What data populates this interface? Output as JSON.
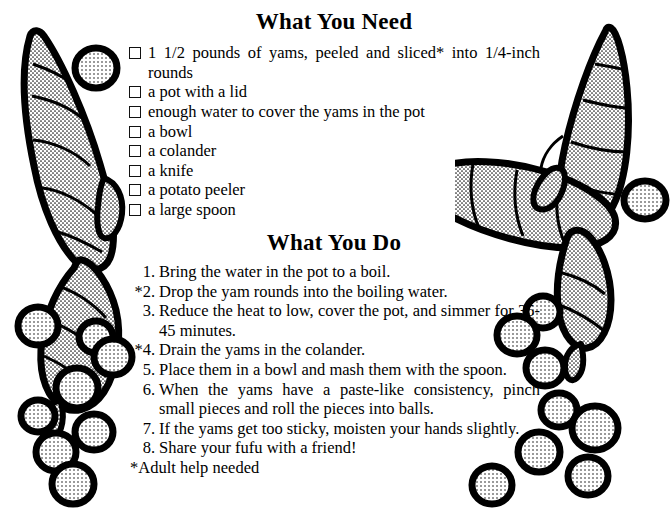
{
  "page": {
    "background_color": "#ffffff",
    "ink_color": "#000000"
  },
  "sections": {
    "needs": {
      "heading": "What You Need",
      "items": [
        "1 1/2 pounds of yams, peeled and sliced* into 1/4-inch rounds",
        "a pot with a lid",
        "enough water to cover the yams in the pot",
        "a bowl",
        "a colander",
        "a knife",
        "a potato peeler",
        "a large spoon"
      ]
    },
    "do": {
      "heading": "What You Do",
      "steps": [
        {
          "marker": "1.",
          "text": "Bring the water in the pot to a boil."
        },
        {
          "marker": "*2.",
          "text": "Drop the yam rounds into the boiling water."
        },
        {
          "marker": "3.",
          "text": "Reduce the heat to low, cover the pot, and simmer for 35-45 minutes."
        },
        {
          "marker": "*4.",
          "text": "Drain the yams in the colander."
        },
        {
          "marker": "5.",
          "text": "Place them in a bowl and mash them with the spoon."
        },
        {
          "marker": "6.",
          "text": "When the yams have a paste-like consistency, pinch small pieces and roll the pieces into balls."
        },
        {
          "marker": "7.",
          "text": "If the yams get too sticky, moisten your hands slightly."
        },
        {
          "marker": "8.",
          "text": "Share your fufu with a friend!"
        }
      ],
      "footnote": "*Adult help needed"
    }
  },
  "artwork": {
    "left_name": "yam-and-fufu-balls-illustration-left",
    "right_name": "yam-and-fufu-balls-illustration-right",
    "description": "black-outlined stippled yam tubers with round fufu balls"
  }
}
